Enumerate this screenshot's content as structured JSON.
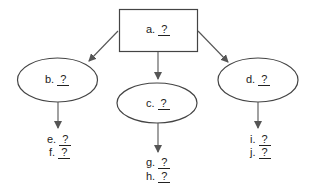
{
  "diagram": {
    "type": "concept-map",
    "colors": {
      "stroke": "#555555",
      "text": "#222222",
      "background": "#ffffff"
    },
    "nodes": [
      {
        "id": "a",
        "shape": "rectangle",
        "prefix": "a.",
        "value": "?"
      },
      {
        "id": "b",
        "shape": "ellipse",
        "prefix": "b.",
        "value": "?"
      },
      {
        "id": "c",
        "shape": "ellipse",
        "prefix": "c.",
        "value": "?"
      },
      {
        "id": "d",
        "shape": "ellipse",
        "prefix": "d.",
        "value": "?"
      }
    ],
    "leaves": [
      {
        "id": "e",
        "parent": "b",
        "prefix": "e.",
        "value": "?"
      },
      {
        "id": "f",
        "parent": "b",
        "prefix": "f.",
        "value": "?"
      },
      {
        "id": "g",
        "parent": "c",
        "prefix": "g.",
        "value": "?"
      },
      {
        "id": "h",
        "parent": "c",
        "prefix": "h.",
        "value": "?"
      },
      {
        "id": "i",
        "parent": "d",
        "prefix": "i.",
        "value": "?"
      },
      {
        "id": "j",
        "parent": "d",
        "prefix": "j.",
        "value": "?"
      }
    ],
    "edges": [
      [
        "a",
        "b"
      ],
      [
        "a",
        "c"
      ],
      [
        "a",
        "d"
      ],
      [
        "b",
        "e-f"
      ],
      [
        "c",
        "g-h"
      ],
      [
        "d",
        "i-j"
      ]
    ]
  }
}
